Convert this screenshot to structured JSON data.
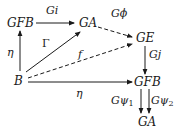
{
  "diagram": {
    "type": "commutative-diagram",
    "nodes": {
      "gfb_top": "GFB",
      "ga_top": "GA",
      "ge": "GE",
      "b": "B",
      "gfb_right": "GFB",
      "ga_bottom": "GA"
    },
    "edges": [
      {
        "from": "GFB",
        "to": "GA",
        "label": "Gi",
        "style": "solid"
      },
      {
        "from": "GA",
        "to": "GE",
        "label": "Gϕ",
        "style": "dashed"
      },
      {
        "from": "B",
        "to": "GFB",
        "label": "η",
        "style": "solid"
      },
      {
        "from": "B",
        "to": "GA",
        "label": "Γ",
        "style": "solid"
      },
      {
        "from": "B",
        "to": "GE",
        "label": "f",
        "style": "dashed"
      },
      {
        "from": "GE",
        "to": "GFB",
        "label": "Gj",
        "style": "solid"
      },
      {
        "from": "B",
        "to": "GFB",
        "label": "η",
        "style": "solid"
      },
      {
        "from": "GFB",
        "to": "GA",
        "label": "Gψ1",
        "style": "solid"
      },
      {
        "from": "GFB",
        "to": "GA",
        "label": "Gψ2",
        "style": "solid"
      }
    ],
    "labels": {
      "gi": "Gi",
      "gphi": "Gϕ",
      "eta_left": "η",
      "gamma": "Γ",
      "f": "f",
      "gj": "Gj",
      "eta_bottom": "η",
      "gpsi1_base": "Gψ",
      "gpsi1_sub": "1",
      "gpsi2_base": "Gψ",
      "gpsi2_sub": "2"
    },
    "colors": {
      "ink": "#1a1a1a",
      "background": "#ffffff"
    }
  }
}
